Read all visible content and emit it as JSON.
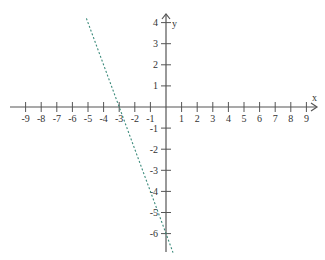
{
  "chart_data": {
    "type": "line",
    "title": "",
    "xlabel": "x",
    "ylabel": "y",
    "xlim": [
      -9,
      9
    ],
    "ylim": [
      -6,
      4
    ],
    "grid": false,
    "legend": null,
    "x_ticks": [
      -9,
      -8,
      -7,
      -6,
      -5,
      -4,
      -3,
      -2,
      -1,
      1,
      2,
      3,
      4,
      5,
      6,
      7,
      8,
      9
    ],
    "y_ticks": [
      4,
      3,
      2,
      1,
      -1,
      -2,
      -3,
      -4,
      -5,
      -6
    ],
    "series": [
      {
        "name": "y = -2x - 6",
        "style": "dashed",
        "color": "#3a8a7a",
        "x": [
          -5.1,
          -3,
          0,
          0.45
        ],
        "y": [
          4.2,
          0,
          -6,
          -6.9
        ]
      }
    ],
    "annotations": {
      "x_intercept": -3,
      "y_intercept": -6
    }
  },
  "colors": {
    "axis": "#555555",
    "line": "#3a8a7a",
    "background": "#ffffff"
  }
}
